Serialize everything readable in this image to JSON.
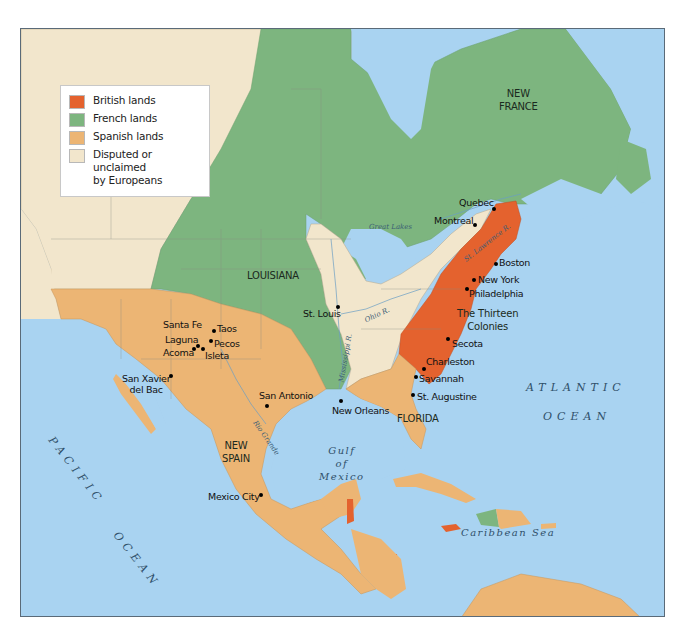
{
  "colors": {
    "british": "#e4622e",
    "french": "#7db57f",
    "spanish": "#ecb574",
    "disputed": "#f2e6cc",
    "water": "#a9d3f1",
    "border": "#5a6a78"
  },
  "legend": {
    "items": [
      {
        "key": "british",
        "label": "British lands",
        "color": "#e4622e"
      },
      {
        "key": "french",
        "label": "French lands",
        "color": "#7db57f"
      },
      {
        "key": "spanish",
        "label": "Spanish lands",
        "color": "#ecb574"
      },
      {
        "key": "disputed",
        "label": "Disputed or unclaimed",
        "label2": "by Europeans",
        "color": "#f2e6cc"
      }
    ]
  },
  "regions": {
    "new_france": [
      "NEW",
      "FRANCE"
    ],
    "louisiana": "LOUISIANA",
    "thirteen_colonies": [
      "The Thirteen",
      "Colonies"
    ],
    "florida": "FLORIDA",
    "new_spain": [
      "NEW",
      "SPAIN"
    ]
  },
  "bodies_of_water": {
    "atlantic": [
      "ATLANTIC",
      "OCEAN"
    ],
    "pacific": [
      "PACIFIC",
      "OCEAN"
    ],
    "gulf": [
      "Gulf",
      "of",
      "Mexico"
    ],
    "caribbean": "Caribbean Sea",
    "great_lakes": "Great Lakes"
  },
  "rivers": {
    "st_lawrence": "St. Lawrence R.",
    "mississippi": "Mississippi R.",
    "ohio": "Ohio R.",
    "rio_grande": "Rio Grande"
  },
  "cities": [
    {
      "name": "Quebec"
    },
    {
      "name": "Montreal"
    },
    {
      "name": "Boston"
    },
    {
      "name": "New York"
    },
    {
      "name": "Philadelphia"
    },
    {
      "name": "Secota"
    },
    {
      "name": "Charleston"
    },
    {
      "name": "Savannah"
    },
    {
      "name": "St. Augustine"
    },
    {
      "name": "New Orleans"
    },
    {
      "name": "St. Louis"
    },
    {
      "name": "San Antonio"
    },
    {
      "name": "Santa Fe"
    },
    {
      "name": "Taos"
    },
    {
      "name": "Laguna"
    },
    {
      "name": "Pecos"
    },
    {
      "name": "Acoma"
    },
    {
      "name": "Isleta"
    },
    {
      "name": "San Xavier",
      "name2": "del Bac"
    },
    {
      "name": "Mexico City"
    }
  ]
}
